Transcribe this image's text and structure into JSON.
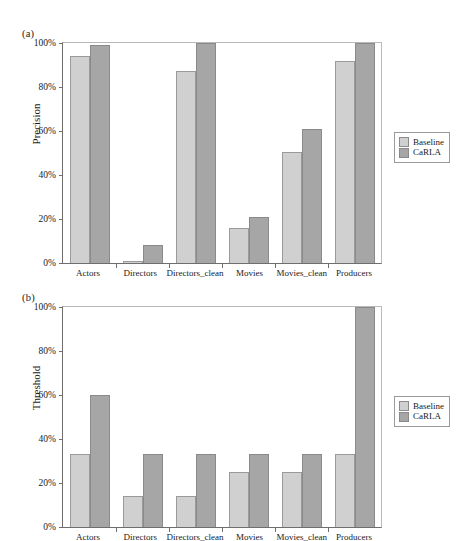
{
  "figure": {
    "panels": [
      {
        "tag": "(a)",
        "ylabel": "Precision",
        "yticks": [
          "0%",
          "20%",
          "40%",
          "60%",
          "80%",
          "100%"
        ]
      },
      {
        "tag": "(b)",
        "ylabel": "Threshold",
        "yticks": [
          "0%",
          "20%",
          "40%",
          "60%",
          "80%",
          "100%"
        ]
      }
    ],
    "legend": {
      "items": [
        {
          "label": "Baseline",
          "color": "#d0d0d0",
          "swatch": "baseline-swatch-icon"
        },
        {
          "label": "CaRLA",
          "color": "#a6a6a6",
          "swatch": "carla-swatch-icon"
        }
      ]
    }
  },
  "chart_data": [
    {
      "type": "bar",
      "panel": "(a)",
      "title": "",
      "xlabel": "",
      "ylabel": "Precision",
      "ylim": [
        0,
        100
      ],
      "yticks": [
        0,
        20,
        40,
        60,
        80,
        100
      ],
      "ytick_labels": [
        "0%",
        "20%",
        "40%",
        "60%",
        "80%",
        "100%"
      ],
      "grid": false,
      "legend_position": "right",
      "categories": [
        "Actors",
        "Directors",
        "Directors_clean",
        "Movies",
        "Movies_clean",
        "Producers"
      ],
      "series": [
        {
          "name": "Baseline",
          "color": "#d0d0d0",
          "values": [
            94,
            1,
            87.5,
            16,
            50.5,
            92
          ]
        },
        {
          "name": "CaRLA",
          "color": "#a6a6a6",
          "values": [
            99,
            8,
            100,
            21,
            61,
            100
          ]
        }
      ]
    },
    {
      "type": "bar",
      "panel": "(b)",
      "title": "",
      "xlabel": "",
      "ylabel": "Threshold",
      "ylim": [
        0,
        100
      ],
      "yticks": [
        0,
        20,
        40,
        60,
        80,
        100
      ],
      "ytick_labels": [
        "0%",
        "20%",
        "40%",
        "60%",
        "80%",
        "100%"
      ],
      "grid": false,
      "legend_position": "right",
      "categories": [
        "Actors",
        "Directors",
        "Directors_clean",
        "Movies",
        "Movies_clean",
        "Producers"
      ],
      "series": [
        {
          "name": "Baseline",
          "color": "#d0d0d0",
          "values": [
            33,
            14,
            14,
            25,
            25,
            33
          ]
        },
        {
          "name": "CaRLA",
          "color": "#a6a6a6",
          "values": [
            60,
            33,
            33,
            33,
            33,
            100
          ]
        }
      ]
    }
  ]
}
